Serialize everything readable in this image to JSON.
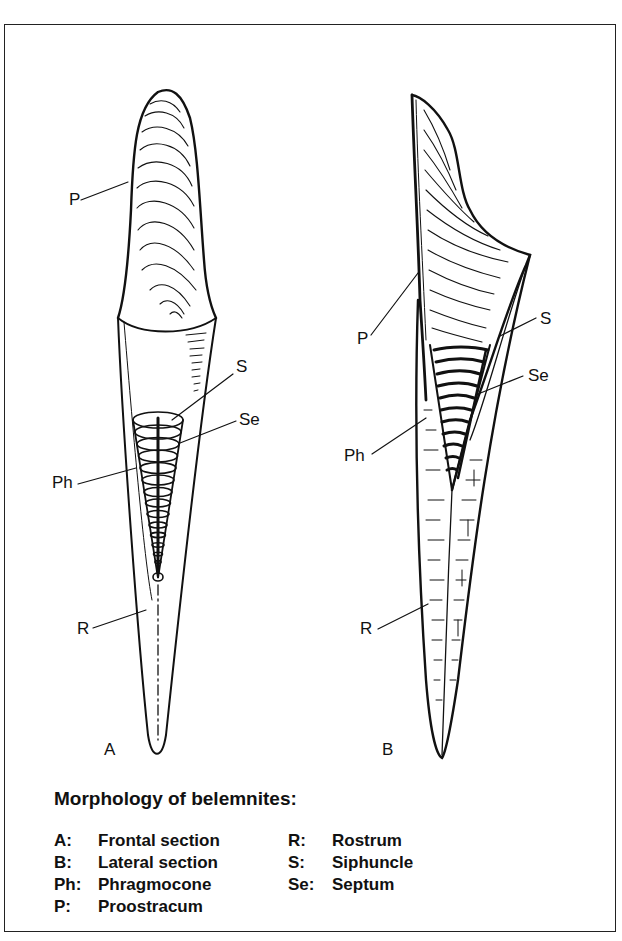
{
  "figure": {
    "panel_a_label": "A",
    "panel_b_label": "B",
    "panel_a_callouts": {
      "P": "P",
      "S": "S",
      "Se": "Se",
      "Ph": "Ph",
      "R": "R"
    },
    "panel_b_callouts": {
      "P": "P",
      "S": "S",
      "Se": "Se",
      "Ph": "Ph",
      "R": "R"
    }
  },
  "caption": {
    "title": "Morphology of belemnites:",
    "legend_left": [
      {
        "key": "A:",
        "value": "Frontal section"
      },
      {
        "key": "B:",
        "value": "Lateral section"
      },
      {
        "key": "Ph:",
        "value": "Phragmocone"
      },
      {
        "key": "P:",
        "value": "Proostracum"
      }
    ],
    "legend_right": [
      {
        "key": "R:",
        "value": "Rostrum"
      },
      {
        "key": "S:",
        "value": "Siphuncle"
      },
      {
        "key": "Se:",
        "value": "Septum"
      }
    ]
  },
  "colors": {
    "ink": "#111111",
    "paper": "#ffffff"
  }
}
